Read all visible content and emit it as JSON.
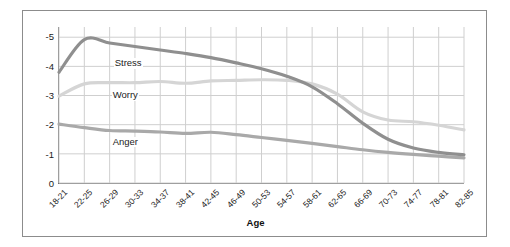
{
  "chart_data": {
    "type": "line",
    "title": "",
    "subtitle": "",
    "xlabel": "Age",
    "ylabel": "",
    "grid": true,
    "legend_position": "inline-labels",
    "categories": [
      "18-21",
      "22-25",
      "26-29",
      "30-33",
      "34-37",
      "38-41",
      "42-45",
      "46-49",
      "50-53",
      "54-57",
      "58-61",
      "62-65",
      "66-69",
      "70-73",
      "74-77",
      "78-81",
      "82-85"
    ],
    "ytick_labels": [
      "-5",
      "-4",
      "-3",
      "-2",
      "-1",
      "0"
    ],
    "ytick_values": [
      5,
      4,
      3,
      2,
      1,
      0
    ],
    "ylim": [
      0,
      5.35
    ],
    "y_inverted_sign": true,
    "series": [
      {
        "name": "Stress",
        "color": "#8f8f8f",
        "values": [
          3.8,
          4.92,
          4.8,
          4.68,
          4.56,
          4.44,
          4.3,
          4.12,
          3.92,
          3.66,
          3.3,
          2.72,
          2.05,
          1.5,
          1.2,
          1.05,
          0.97
        ]
      },
      {
        "name": "Worry",
        "color": "#d5d5d5",
        "values": [
          2.98,
          3.4,
          3.44,
          3.44,
          3.48,
          3.42,
          3.5,
          3.52,
          3.54,
          3.52,
          3.4,
          3.05,
          2.44,
          2.16,
          2.1,
          1.98,
          1.82
        ]
      },
      {
        "name": "Anger",
        "color": "#a9a9a9",
        "values": [
          2.02,
          1.9,
          1.8,
          1.78,
          1.75,
          1.7,
          1.74,
          1.66,
          1.56,
          1.46,
          1.36,
          1.25,
          1.14,
          1.05,
          0.98,
          0.92,
          0.86
        ]
      }
    ],
    "series_label_positions": [
      {
        "name": "Stress",
        "x_pct": 13.5,
        "y_pct": 20.0
      },
      {
        "name": "Worry",
        "x_pct": 13.0,
        "y_pct": 40.5
      },
      {
        "name": "Anger",
        "x_pct": 13.0,
        "y_pct": 70.5
      }
    ],
    "colors": {
      "stress": "#8f8f8f",
      "worry": "#d5d5d5",
      "anger": "#a9a9a9",
      "grid": "#cfcfcf",
      "axis": "#6f6f6f",
      "frame": "#8c8c8c",
      "text": "#1b1b1b",
      "background": "#ffffff"
    }
  }
}
